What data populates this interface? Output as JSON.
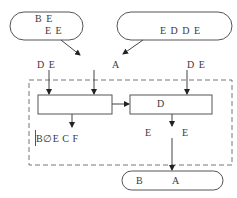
{
  "diagram": {
    "top_left_oval": {
      "line1": "B  E",
      "line2": "E E"
    },
    "top_right_oval": {
      "text": "E D   D E"
    },
    "merge_label": "A",
    "left_input_label": "D E",
    "right_input_label": "D E",
    "box_left": {
      "text": ""
    },
    "box_right": {
      "text": "D"
    },
    "left_output_label": "B∅E C  F",
    "right_output_left_label": "E",
    "right_output_right_label": "E",
    "bottom_oval": {
      "left": "B",
      "right": "A"
    },
    "colors": {
      "stroke": "#555555",
      "dash": "#777777",
      "text": "#3a3a3a"
    }
  }
}
